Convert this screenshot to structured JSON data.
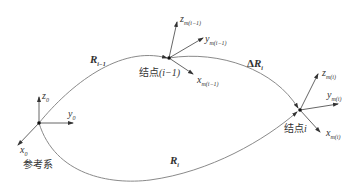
{
  "diagram": {
    "type": "coordinate-frames-vector-diagram",
    "reference_frame": {
      "label": "参考系",
      "axes": {
        "x": "x",
        "x_sub": "0",
        "y": "y",
        "y_sub": "0",
        "z": "z",
        "z_sub": "0"
      }
    },
    "node_prev": {
      "label_prefix": "结点",
      "label_index": "(i−1)",
      "axes": {
        "x": "x",
        "x_sub": "m(i−1)",
        "y": "y",
        "y_sub": "m(i−1)",
        "z": "z",
        "z_sub": "m(i−1)"
      }
    },
    "node_curr": {
      "label_prefix": "结点",
      "label_index": "i",
      "axes": {
        "x": "x",
        "x_sub": "m(i)",
        "y": "y",
        "y_sub": "m(i)",
        "z": "z",
        "z_sub": "m(i)"
      }
    },
    "vectors": {
      "r_prev": {
        "symbol": "R",
        "sub": "i−1"
      },
      "r_curr": {
        "symbol": "R",
        "sub": "i"
      },
      "delta_r": {
        "prefix": "Δ",
        "symbol": "R",
        "sub": "i"
      }
    },
    "colors": {
      "line": "#8a8a8a",
      "axis": "#444444",
      "node": "#111111"
    }
  }
}
